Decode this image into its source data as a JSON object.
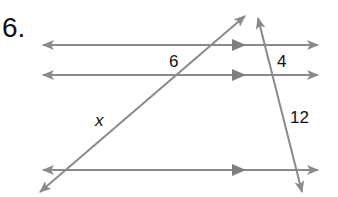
{
  "problem": {
    "number_label": "6."
  },
  "diagram": {
    "line_color": "#8a8a8a",
    "parallel_lines": [
      {
        "id": "top",
        "y": 45,
        "x1": 43,
        "x2": 318,
        "mid_arrow_x": 240
      },
      {
        "id": "middle",
        "y": 75,
        "x1": 43,
        "x2": 318,
        "mid_arrow_x": 240
      },
      {
        "id": "bottom",
        "y": 170,
        "x1": 43,
        "x2": 318,
        "mid_arrow_x": 240
      }
    ],
    "transversals": [
      {
        "id": "left",
        "x1": 40,
        "y1": 192,
        "x2": 245,
        "y2": 16
      },
      {
        "id": "right",
        "x1": 258,
        "y1": 18,
        "x2": 302,
        "y2": 192
      }
    ],
    "labels": {
      "left_top_segment": "6",
      "right_top_segment": "4",
      "left_bottom_segment": "x",
      "right_bottom_segment": "12"
    }
  }
}
